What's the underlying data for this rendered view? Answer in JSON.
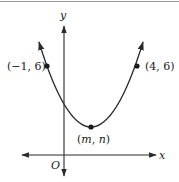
{
  "figure": {
    "type": "coordinate-graph-parabola",
    "axes": {
      "x_label": "x",
      "y_label": "y",
      "origin_label": "O"
    },
    "points": [
      {
        "name": "left-point",
        "label": "(−1, 6)",
        "x": -1,
        "y": 6
      },
      {
        "name": "right-point",
        "label": "(4, 6)",
        "x": 4,
        "y": 6
      },
      {
        "name": "vertex",
        "label": "(m, n)",
        "x": "m",
        "y": "n"
      }
    ],
    "labels": {
      "left_point": "(−1, 6)",
      "right_point": "(4, 6)",
      "vertex_open": "(",
      "vertex_m": "m",
      "vertex_sep": ", ",
      "vertex_n": "n",
      "vertex_close": ")"
    },
    "colors": {
      "stroke": "#2a2a2a",
      "border": "#9a9a9a",
      "background": "#ffffff"
    }
  }
}
